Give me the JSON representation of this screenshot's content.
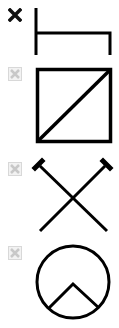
{
  "palette": {
    "options": [
      {
        "id": "bracket-shape",
        "icon": "bracket-icon",
        "selected": true
      },
      {
        "id": "square-diagonal-shape",
        "icon": "square-diagonal-icon",
        "selected": false
      },
      {
        "id": "cross-pins-shape",
        "icon": "crossed-pins-icon",
        "selected": false
      },
      {
        "id": "circle-chevron-shape",
        "icon": "circle-chevron-icon",
        "selected": false
      }
    ],
    "colors": {
      "stroke": "#000000",
      "indicator_selected": "#111111",
      "indicator_unselected": "#c8c8c8",
      "background": "#ffffff"
    }
  }
}
